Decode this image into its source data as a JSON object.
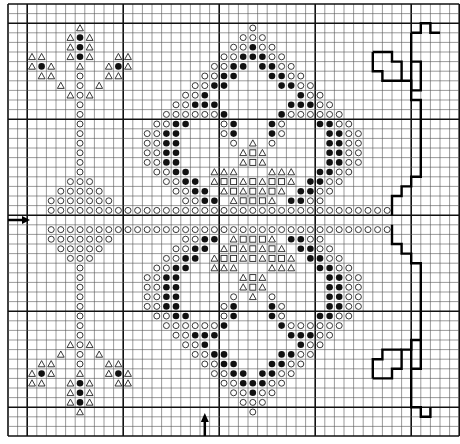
{
  "chart_title": "",
  "grid": {
    "cols": 47,
    "rows": 45,
    "cell_size": 9.6,
    "origin_x": 8,
    "origin_y": 4,
    "heavy_every": 10,
    "heavy_offset": 2,
    "line_color": "#555555",
    "heavy_color": "#111111"
  },
  "legend_symbols": {
    "o": "open-circle",
    "f": "filled-circle",
    "t": "open-triangle",
    "s": "open-square"
  },
  "center_markers": {
    "left_arrow_row": 22,
    "bottom_arrow_col": 20
  },
  "stitches_upper_half": [
    {
      "r": 2,
      "o": [
        25
      ],
      "t": [
        7
      ]
    },
    {
      "r": 3,
      "o": [
        24,
        25,
        26
      ],
      "t": [
        6,
        8
      ],
      "f": [
        7
      ]
    },
    {
      "r": 4,
      "o": [
        23,
        24,
        26,
        27
      ],
      "f": [
        25,
        7
      ],
      "t": [
        6,
        8
      ]
    },
    {
      "r": 5,
      "o": [
        22,
        23,
        27,
        28
      ],
      "f": [
        24,
        25,
        26,
        7
      ],
      "t": [
        2,
        3,
        6,
        8,
        11,
        12
      ]
    },
    {
      "r": 6,
      "o": [
        21,
        22,
        28,
        29
      ],
      "f": [
        23,
        24,
        26,
        27,
        3,
        11
      ],
      "t": [
        2,
        4,
        7,
        10,
        12
      ]
    },
    {
      "r": 7,
      "o": [
        20,
        21,
        29,
        30,
        7
      ],
      "f": [
        22,
        23,
        27,
        28
      ],
      "t": [
        3,
        4,
        10,
        11
      ]
    },
    {
      "r": 8,
      "o": [
        19,
        20,
        30,
        31,
        7
      ],
      "f": [
        21,
        22,
        28,
        29
      ],
      "t": [
        5,
        9
      ]
    },
    {
      "r": 9,
      "o": [
        18,
        19,
        31,
        32,
        7
      ],
      "f": [
        20,
        30
      ],
      "t": [
        6,
        8
      ]
    },
    {
      "r": 10,
      "o": [
        17,
        18,
        32,
        33,
        7
      ],
      "f": [
        19,
        20,
        21,
        29,
        30,
        31
      ]
    },
    {
      "r": 11,
      "o": [
        16,
        17,
        18,
        19,
        20,
        21,
        29,
        30,
        31,
        32,
        33,
        34,
        7
      ],
      "f": [
        22,
        28
      ]
    },
    {
      "r": 12,
      "o": [
        15,
        16,
        22,
        28,
        34,
        35,
        7
      ],
      "f": [
        17,
        18,
        23,
        27,
        32,
        33
      ]
    },
    {
      "r": 13,
      "o": [
        14,
        15,
        22,
        28,
        35,
        36,
        7
      ],
      "f": [
        16,
        17,
        23,
        27,
        33,
        34
      ]
    },
    {
      "r": 14,
      "o": [
        14,
        15,
        23,
        27,
        35,
        36,
        7
      ],
      "f": [
        16,
        17,
        33,
        34
      ],
      "t": [
        25
      ]
    },
    {
      "r": 15,
      "o": [
        14,
        15,
        35,
        36,
        7
      ],
      "f": [
        16,
        17,
        33,
        34
      ],
      "t": [
        24,
        26
      ],
      "s": [
        25
      ]
    },
    {
      "r": 16,
      "o": [
        14,
        15,
        35,
        36,
        7
      ],
      "f": [
        16,
        17,
        33,
        34
      ],
      "t": [
        24,
        26
      ],
      "s": [
        25
      ]
    },
    {
      "r": 17,
      "o": [
        15,
        16,
        34,
        35,
        7
      ],
      "f": [
        17,
        18,
        32,
        33
      ],
      "t": [
        21,
        22,
        23,
        27,
        28,
        29
      ]
    },
    {
      "r": 18,
      "o": [
        16,
        17,
        33,
        34,
        6,
        7,
        8
      ],
      "f": [
        18,
        19,
        31,
        32
      ],
      "t": [
        21,
        24,
        26,
        29
      ],
      "s": [
        22,
        23,
        25,
        27,
        28
      ]
    },
    {
      "r": 19,
      "o": [
        17,
        18,
        32,
        33,
        5,
        6,
        7,
        8,
        9
      ],
      "f": [
        19,
        20,
        30,
        31
      ],
      "t": [
        22,
        24,
        26,
        28
      ],
      "s": [
        23,
        25,
        27
      ]
    },
    {
      "r": 20,
      "o": [
        4,
        5,
        6,
        7,
        8,
        9,
        10,
        18,
        19,
        31,
        32
      ],
      "f": [
        20,
        21,
        29,
        30
      ],
      "t": [
        23,
        27
      ],
      "s": [
        24,
        25,
        26
      ]
    },
    {
      "r": 21,
      "o": [
        4,
        5,
        6,
        7,
        8,
        9,
        10,
        11,
        12,
        13,
        14,
        15,
        16,
        17,
        18,
        19,
        20,
        21,
        22,
        23,
        24,
        25,
        26,
        27,
        28,
        29,
        30,
        31,
        32,
        33,
        34,
        35,
        36,
        37,
        38,
        39
      ]
    }
  ],
  "mirror_row": 22,
  "outline_paths": [
    [
      [
        42,
        3
      ],
      [
        43,
        3
      ],
      [
        43,
        2
      ],
      [
        44,
        2
      ],
      [
        44,
        3
      ],
      [
        45,
        3
      ]
    ],
    [
      [
        42,
        3
      ],
      [
        42,
        10
      ],
      [
        43,
        10
      ],
      [
        43,
        18
      ],
      [
        42,
        18
      ],
      [
        42,
        19
      ],
      [
        41,
        19
      ],
      [
        41,
        20
      ],
      [
        40,
        20
      ],
      [
        40,
        22
      ]
    ],
    [
      [
        38,
        5
      ],
      [
        40,
        5
      ],
      [
        40,
        6
      ],
      [
        41,
        6
      ],
      [
        41,
        8
      ],
      [
        42,
        8
      ],
      [
        42,
        9
      ],
      [
        43,
        9
      ],
      [
        43,
        6
      ],
      [
        42,
        6
      ]
    ],
    [
      [
        38,
        5
      ],
      [
        38,
        7
      ],
      [
        39,
        7
      ],
      [
        39,
        8
      ],
      [
        41,
        8
      ]
    ],
    [
      [
        40,
        23
      ],
      [
        40,
        25
      ],
      [
        41,
        25
      ],
      [
        41,
        26
      ],
      [
        42,
        26
      ],
      [
        42,
        27
      ],
      [
        43,
        27
      ],
      [
        43,
        35
      ],
      [
        42,
        35
      ],
      [
        42,
        42
      ],
      [
        43,
        42
      ],
      [
        43,
        43
      ],
      [
        44,
        43
      ],
      [
        44,
        42
      ]
    ],
    [
      [
        38,
        39
      ],
      [
        40,
        39
      ],
      [
        40,
        38
      ],
      [
        41,
        38
      ],
      [
        41,
        36
      ],
      [
        42,
        36
      ],
      [
        42,
        35
      ]
    ],
    [
      [
        38,
        39
      ],
      [
        38,
        37
      ],
      [
        39,
        37
      ],
      [
        39,
        36
      ],
      [
        41,
        36
      ]
    ],
    [
      [
        42,
        38
      ],
      [
        43,
        38
      ],
      [
        43,
        35
      ]
    ]
  ]
}
